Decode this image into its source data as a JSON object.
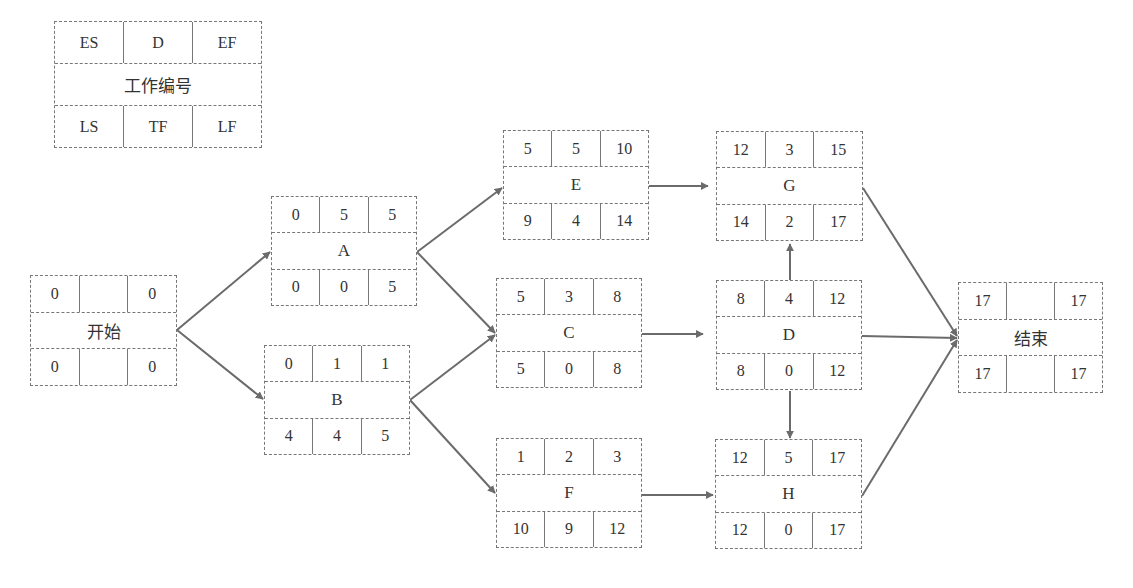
{
  "legend": {
    "top": [
      "ES",
      "D",
      "EF"
    ],
    "name": "工作编号",
    "bottom": [
      "LS",
      "TF",
      "LF"
    ]
  },
  "nodes": {
    "start": {
      "name": "开始",
      "top": [
        "0",
        "",
        "0"
      ],
      "bottom": [
        "0",
        "",
        "0"
      ]
    },
    "A": {
      "name": "A",
      "top": [
        "0",
        "5",
        "5"
      ],
      "bottom": [
        "0",
        "0",
        "5"
      ]
    },
    "B": {
      "name": "B",
      "top": [
        "0",
        "1",
        "1"
      ],
      "bottom": [
        "4",
        "4",
        "5"
      ]
    },
    "E": {
      "name": "E",
      "top": [
        "5",
        "5",
        "10"
      ],
      "bottom": [
        "9",
        "4",
        "14"
      ]
    },
    "C": {
      "name": "C",
      "top": [
        "5",
        "3",
        "8"
      ],
      "bottom": [
        "5",
        "0",
        "8"
      ]
    },
    "F": {
      "name": "F",
      "top": [
        "1",
        "2",
        "3"
      ],
      "bottom": [
        "10",
        "9",
        "12"
      ]
    },
    "G": {
      "name": "G",
      "top": [
        "12",
        "3",
        "15"
      ],
      "bottom": [
        "14",
        "2",
        "17"
      ]
    },
    "D": {
      "name": "D",
      "top": [
        "8",
        "4",
        "12"
      ],
      "bottom": [
        "8",
        "0",
        "12"
      ]
    },
    "H": {
      "name": "H",
      "top": [
        "12",
        "5",
        "17"
      ],
      "bottom": [
        "12",
        "0",
        "17"
      ]
    },
    "end": {
      "name": "结束",
      "top": [
        "17",
        "",
        "17"
      ],
      "bottom": [
        "17",
        "",
        "17"
      ]
    }
  },
  "edges": [
    [
      "start",
      "A"
    ],
    [
      "start",
      "B"
    ],
    [
      "A",
      "E"
    ],
    [
      "A",
      "C"
    ],
    [
      "B",
      "C"
    ],
    [
      "B",
      "F"
    ],
    [
      "E",
      "G"
    ],
    [
      "C",
      "D"
    ],
    [
      "F",
      "H"
    ],
    [
      "D",
      "G"
    ],
    [
      "D",
      "H"
    ],
    [
      "G",
      "end"
    ],
    [
      "D",
      "end"
    ],
    [
      "H",
      "end"
    ]
  ],
  "colors": {
    "arrow": "#6b6b6b",
    "border": "#777777"
  }
}
